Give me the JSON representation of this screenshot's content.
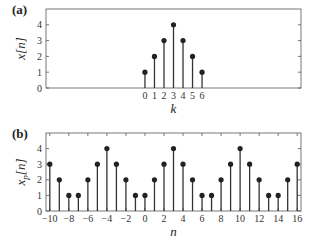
{
  "chart_data": [
    {
      "type": "stem",
      "panel_label": "(a)",
      "xlabel": "k",
      "ylabel": "x[n]",
      "x": [
        0,
        1,
        2,
        3,
        4,
        5,
        6
      ],
      "values": [
        1,
        2,
        3,
        4,
        3,
        2,
        1
      ],
      "xticks": [
        0,
        1,
        2,
        3,
        4,
        5,
        6
      ],
      "yticks": [
        0,
        1,
        2,
        3,
        4
      ],
      "xlim": [
        -10.4,
        16.4
      ],
      "ylim": [
        0,
        5
      ],
      "grid": false
    },
    {
      "type": "stem",
      "panel_label": "(b)",
      "xlabel": "n",
      "ylabel": "x_p[n]",
      "x": [
        -10,
        -9,
        -8,
        -7,
        -6,
        -5,
        -4,
        -3,
        -2,
        -1,
        0,
        1,
        2,
        3,
        4,
        5,
        6,
        7,
        8,
        9,
        10,
        11,
        12,
        13,
        14,
        15,
        16
      ],
      "values": [
        3,
        2,
        1,
        1,
        2,
        3,
        4,
        3,
        2,
        1,
        1,
        2,
        3,
        4,
        3,
        2,
        1,
        1,
        2,
        3,
        4,
        3,
        2,
        1,
        1,
        2,
        3
      ],
      "xticks": [
        -10,
        -8,
        -6,
        -4,
        -2,
        0,
        2,
        4,
        6,
        8,
        10,
        12,
        14,
        16
      ],
      "yticks": [
        0,
        1,
        2,
        3,
        4
      ],
      "xlim": [
        -10.4,
        16.4
      ],
      "ylim": [
        0,
        5
      ],
      "grid": false
    }
  ],
  "panels": [
    {
      "label": "(a)",
      "ylabel_main": "x",
      "ylabel_sub": "",
      "ylabel_arg": "[n]",
      "xlabel": "k"
    },
    {
      "label": "(b)",
      "ylabel_main": "x",
      "ylabel_sub": "p",
      "ylabel_arg": "[n]",
      "xlabel": "n"
    }
  ],
  "colors": {
    "stem": "#333333",
    "marker": "#222222",
    "axis": "#555555"
  }
}
